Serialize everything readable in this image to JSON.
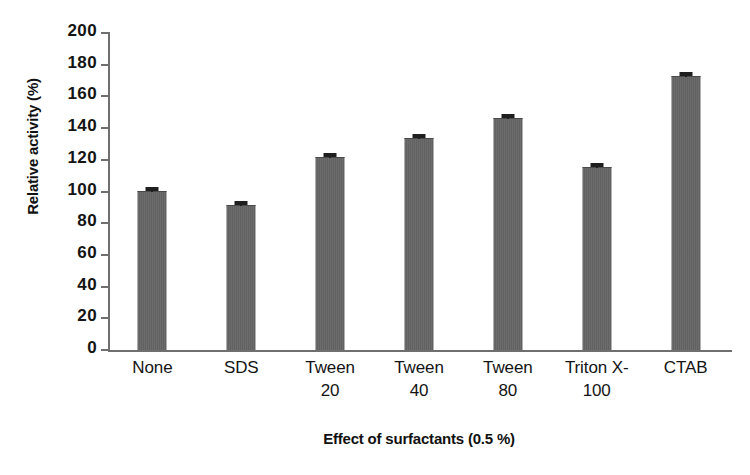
{
  "chart_data": {
    "type": "bar",
    "title": "",
    "xlabel": "Effect of surfactants (0.5 %)",
    "ylabel": "Relative activity (%)",
    "categories": [
      "None",
      "SDS",
      "Tween 20",
      "Tween 40",
      "Tween 80",
      "Triton X-100",
      "CTAB"
    ],
    "category_lines": [
      {
        "line1": "None",
        "line2": ""
      },
      {
        "line1": "SDS",
        "line2": ""
      },
      {
        "line1": "Tween",
        "line2": "20"
      },
      {
        "line1": "Tween",
        "line2": "40"
      },
      {
        "line1": "Tween",
        "line2": "80"
      },
      {
        "line1": "Triton X-",
        "line2": "100"
      },
      {
        "line1": "CTAB",
        "line2": ""
      }
    ],
    "values": [
      100,
      91,
      121,
      133,
      146,
      115,
      172
    ],
    "errors": [
      1.5,
      1.5,
      1.5,
      1.5,
      1.5,
      1.5,
      1.5
    ],
    "ylim": [
      0,
      200
    ],
    "ytick_step": 20,
    "yticks": [
      0,
      20,
      40,
      60,
      80,
      100,
      120,
      140,
      160,
      180,
      200
    ],
    "ytick_labels": [
      "0",
      "20",
      "40",
      "60",
      "80",
      "100",
      "120",
      "140",
      "160",
      "180",
      "200"
    ],
    "grid": false,
    "legend": false,
    "bar_color": "#666666",
    "axis_color": "#6f6f6f",
    "error_bar_color": "#1f1f1f",
    "background_color": "#ffffff"
  }
}
